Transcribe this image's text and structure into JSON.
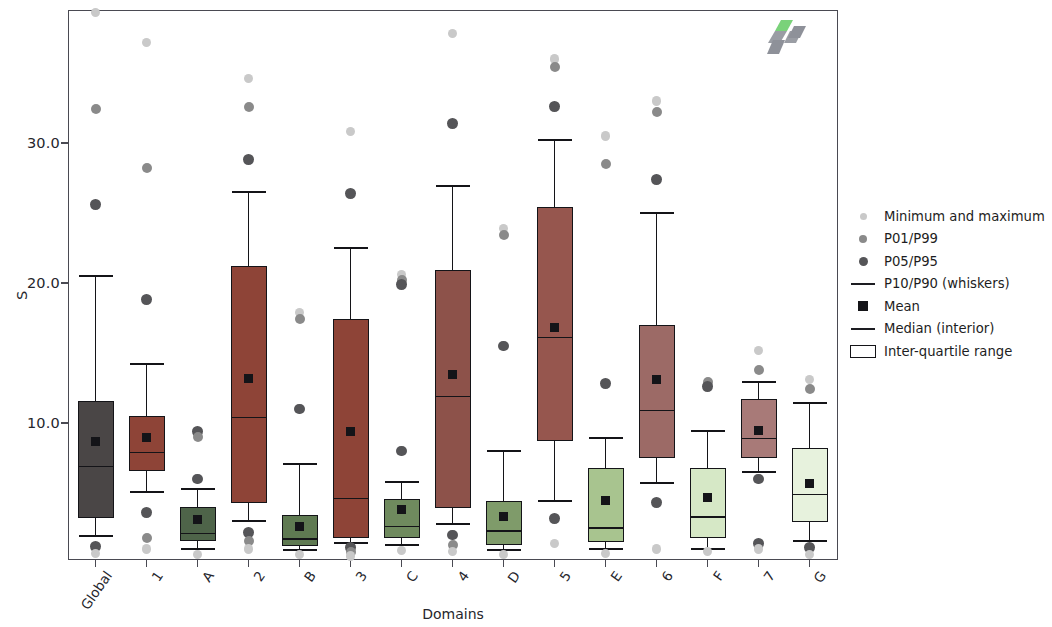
{
  "chart_data": {
    "type": "box",
    "title": "",
    "xlabel": "Domains",
    "ylabel": "S",
    "ylim": [
      0,
      39.3
    ],
    "yticks": [
      10.0,
      20.0,
      30.0
    ],
    "ytick_labels": [
      "10.0",
      "20.0",
      "30.0"
    ],
    "grid": false,
    "categories": [
      "Global",
      "1",
      "A",
      "2",
      "B",
      "3",
      "C",
      "4",
      "D",
      "5",
      "E",
      "6",
      "F",
      "7",
      "G"
    ],
    "legend": {
      "position": "right",
      "entries": [
        {
          "label": "Minimum and maximum",
          "marker": "dot",
          "color": "#c9c9c9",
          "size": 7
        },
        {
          "label": "P01/P99",
          "marker": "dot",
          "color": "#8a8a8a",
          "size": 8
        },
        {
          "label": "P05/P95",
          "marker": "dot",
          "color": "#555558",
          "size": 9
        },
        {
          "label": "P10/P90 (whiskers)",
          "marker": "line",
          "color": "#1d1d22"
        },
        {
          "label": "Mean",
          "marker": "square",
          "color": "#141418"
        },
        {
          "label": "Median (interior)",
          "marker": "line",
          "color": "#1d1d22"
        },
        {
          "label": "Inter-quartile range",
          "marker": "box",
          "color": "#141418"
        }
      ]
    },
    "boxes": [
      {
        "name": "Global",
        "color": "#4a4646",
        "q1": 3.2,
        "q3": 11.6,
        "median": 6.9,
        "mean": 8.7,
        "p10": 1.9,
        "p90": 20.5,
        "outliers": [
          {
            "v": 39.3,
            "t": "min_max"
          },
          {
            "v": 32.4,
            "t": "p01_p99"
          },
          {
            "v": 25.6,
            "t": "p05_p95"
          },
          {
            "v": 1.2,
            "t": "p05_p95"
          },
          {
            "v": 0.7,
            "t": "min_max"
          }
        ]
      },
      {
        "name": "1",
        "color": "#8e4437",
        "q1": 6.6,
        "q3": 10.5,
        "median": 7.9,
        "mean": 9.0,
        "p10": 5.1,
        "p90": 14.2,
        "outliers": [
          {
            "v": 37.2,
            "t": "min_max"
          },
          {
            "v": 28.2,
            "t": "p01_p99"
          },
          {
            "v": 18.8,
            "t": "p05_p95"
          },
          {
            "v": 3.6,
            "t": "p05_p95"
          },
          {
            "v": 1.8,
            "t": "p01_p99"
          },
          {
            "v": 1.0,
            "t": "min_max"
          }
        ]
      },
      {
        "name": "A",
        "color": "#4e6449",
        "q1": 1.6,
        "q3": 4.0,
        "median": 2.1,
        "mean": 3.1,
        "p10": 1.0,
        "p90": 5.3,
        "outliers": [
          {
            "v": 9.4,
            "t": "p05_p95"
          },
          {
            "v": 9.0,
            "t": "p01_p99"
          },
          {
            "v": 6.0,
            "t": "p05_p95"
          },
          {
            "v": 0.6,
            "t": "min_max"
          }
        ]
      },
      {
        "name": "2",
        "color": "#8e4437",
        "q1": 4.3,
        "q3": 21.2,
        "median": 10.4,
        "mean": 13.2,
        "p10": 3.0,
        "p90": 26.5,
        "outliers": [
          {
            "v": 34.6,
            "t": "min_max"
          },
          {
            "v": 32.6,
            "t": "p01_p99"
          },
          {
            "v": 28.8,
            "t": "p05_p95"
          },
          {
            "v": 2.2,
            "t": "p05_p95"
          },
          {
            "v": 1.6,
            "t": "p01_p99"
          },
          {
            "v": 1.0,
            "t": "min_max"
          }
        ]
      },
      {
        "name": "B",
        "color": "#5f7a52",
        "q1": 1.2,
        "q3": 3.4,
        "median": 1.7,
        "mean": 2.6,
        "p10": 0.9,
        "p90": 7.1,
        "outliers": [
          {
            "v": 17.9,
            "t": "min_max"
          },
          {
            "v": 17.4,
            "t": "p01_p99"
          },
          {
            "v": 11.0,
            "t": "p05_p95"
          },
          {
            "v": 0.6,
            "t": "min_max"
          }
        ]
      },
      {
        "name": "3",
        "color": "#8e4437",
        "q1": 1.8,
        "q3": 17.4,
        "median": 4.6,
        "mean": 9.4,
        "p10": 1.4,
        "p90": 22.5,
        "outliers": [
          {
            "v": 30.8,
            "t": "min_max"
          },
          {
            "v": 26.4,
            "t": "p05_p95"
          },
          {
            "v": 1.1,
            "t": "p05_p95"
          },
          {
            "v": 0.8,
            "t": "p01_p99"
          },
          {
            "v": 0.5,
            "t": "min_max"
          }
        ]
      },
      {
        "name": "C",
        "color": "#6f8a5e",
        "q1": 1.8,
        "q3": 4.6,
        "median": 2.6,
        "mean": 3.8,
        "p10": 1.3,
        "p90": 5.8,
        "outliers": [
          {
            "v": 20.6,
            "t": "min_max"
          },
          {
            "v": 20.2,
            "t": "p01_p99"
          },
          {
            "v": 19.9,
            "t": "p05_p95"
          },
          {
            "v": 8.0,
            "t": "p05_p95"
          },
          {
            "v": 0.9,
            "t": "min_max"
          }
        ]
      },
      {
        "name": "4",
        "color": "#8d524a",
        "q1": 3.9,
        "q3": 20.9,
        "median": 11.9,
        "mean": 13.5,
        "p10": 2.8,
        "p90": 26.9,
        "outliers": [
          {
            "v": 37.8,
            "t": "min_max"
          },
          {
            "v": 31.4,
            "t": "p05_p95"
          },
          {
            "v": 2.0,
            "t": "p05_p95"
          },
          {
            "v": 1.3,
            "t": "p01_p99"
          },
          {
            "v": 0.8,
            "t": "min_max"
          }
        ]
      },
      {
        "name": "D",
        "color": "#7f9b6a",
        "q1": 1.3,
        "q3": 4.4,
        "median": 2.3,
        "mean": 3.3,
        "p10": 0.9,
        "p90": 8.0,
        "outliers": [
          {
            "v": 23.9,
            "t": "min_max"
          },
          {
            "v": 23.4,
            "t": "p01_p99"
          },
          {
            "v": 15.5,
            "t": "p05_p95"
          },
          {
            "v": 0.6,
            "t": "min_max"
          }
        ]
      },
      {
        "name": "5",
        "color": "#96564e",
        "q1": 8.7,
        "q3": 25.4,
        "median": 16.1,
        "mean": 16.8,
        "p10": 4.4,
        "p90": 30.2,
        "outliers": [
          {
            "v": 36.0,
            "t": "min_max"
          },
          {
            "v": 35.4,
            "t": "p01_p99"
          },
          {
            "v": 32.6,
            "t": "p05_p95"
          },
          {
            "v": 3.2,
            "t": "p05_p95"
          },
          {
            "v": 1.4,
            "t": "min_max"
          }
        ]
      },
      {
        "name": "E",
        "color": "#a8c48f",
        "q1": 1.5,
        "q3": 6.8,
        "median": 2.5,
        "mean": 4.5,
        "p10": 1.0,
        "p90": 8.9,
        "outliers": [
          {
            "v": 30.5,
            "t": "min_max"
          },
          {
            "v": 28.5,
            "t": "p01_p99"
          },
          {
            "v": 12.8,
            "t": "p05_p95"
          },
          {
            "v": 0.7,
            "t": "min_max"
          }
        ]
      },
      {
        "name": "6",
        "color": "#9c6a66",
        "q1": 7.5,
        "q3": 17.0,
        "median": 10.9,
        "mean": 13.1,
        "p10": 5.7,
        "p90": 25.0,
        "outliers": [
          {
            "v": 33.0,
            "t": "min_max"
          },
          {
            "v": 32.2,
            "t": "p01_p99"
          },
          {
            "v": 27.4,
            "t": "p05_p95"
          },
          {
            "v": 4.3,
            "t": "p05_p95"
          },
          {
            "v": 1.0,
            "t": "min_max"
          }
        ]
      },
      {
        "name": "F",
        "color": "#d6e8c6",
        "q1": 1.8,
        "q3": 6.8,
        "median": 3.3,
        "mean": 4.7,
        "p10": 1.0,
        "p90": 9.4,
        "outliers": [
          {
            "v": 12.9,
            "t": "p01_p99"
          },
          {
            "v": 12.6,
            "t": "p05_p95"
          },
          {
            "v": 0.8,
            "t": "min_max"
          }
        ]
      },
      {
        "name": "7",
        "color": "#a87a78",
        "q1": 7.5,
        "q3": 11.7,
        "median": 8.9,
        "mean": 9.5,
        "p10": 6.5,
        "p90": 12.9,
        "outliers": [
          {
            "v": 15.2,
            "t": "min_max"
          },
          {
            "v": 13.8,
            "t": "p01_p99"
          },
          {
            "v": 6.0,
            "t": "p05_p95"
          },
          {
            "v": 1.4,
            "t": "p05_p95"
          },
          {
            "v": 1.0,
            "t": "min_max"
          }
        ]
      },
      {
        "name": "G",
        "color": "#e7f2dd",
        "q1": 2.9,
        "q3": 8.2,
        "median": 4.9,
        "mean": 5.7,
        "p10": 1.6,
        "p90": 11.4,
        "outliers": [
          {
            "v": 13.1,
            "t": "min_max"
          },
          {
            "v": 12.4,
            "t": "p01_p99"
          },
          {
            "v": 1.1,
            "t": "p05_p95"
          },
          {
            "v": 0.6,
            "t": "min_max"
          }
        ]
      }
    ],
    "outlier_colors": {
      "min_max": "#c9c9c9",
      "p01_p99": "#8a8a8a",
      "p05_p95": "#555558"
    }
  },
  "logo": {
    "name": "chevron-logo",
    "green": "#7ad27a",
    "gray": "#8e9199"
  }
}
